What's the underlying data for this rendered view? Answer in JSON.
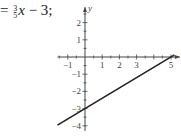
{
  "equation": {
    "prefix": "=",
    "frac_num": "3",
    "frac_den": "5",
    "var": "x",
    "rest": " − 3;"
  },
  "chart_data": {
    "type": "line",
    "title": "",
    "xlabel": "x",
    "ylabel": "y",
    "xlim": [
      -1.6,
      5.4
    ],
    "ylim": [
      -4.3,
      2.9
    ],
    "x_ticks": [
      -1,
      1,
      2,
      3,
      5
    ],
    "y_ticks": [
      2,
      1,
      -1,
      -2,
      -3,
      -4
    ],
    "series": [
      {
        "name": "y = (3/5)x − 3",
        "x": [
          -1.6,
          5.2
        ],
        "values": [
          -3.96,
          0.12
        ],
        "color": "#222222"
      }
    ],
    "intercepts": {
      "x": 5,
      "y": -3
    },
    "grid": false
  }
}
